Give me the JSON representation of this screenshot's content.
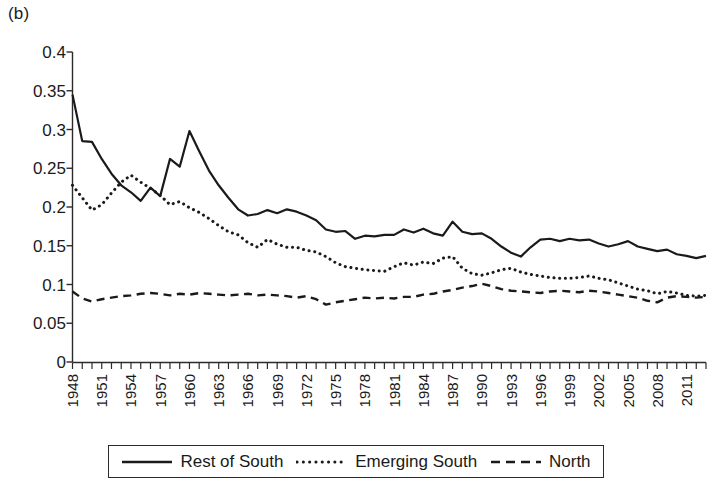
{
  "figure": {
    "panel_label": "(b)",
    "background_color": "#ffffff",
    "line_color": "#1a1a1a"
  },
  "legend": {
    "position": "bottom",
    "entries": [
      {
        "label": "Rest of South",
        "style": "solid",
        "name": "rest-of-south"
      },
      {
        "label": "Emerging South",
        "style": "dotted",
        "name": "emerging-south"
      },
      {
        "label": "North",
        "style": "dashed",
        "name": "north"
      }
    ]
  },
  "axes": {
    "y_ticks": [
      "0.4",
      "0.35",
      "0.3",
      "0.25",
      "0.2",
      "0.15",
      "0.1",
      "0.05",
      "0"
    ],
    "y_min": 0,
    "y_max": 0.4,
    "y_step": 0.05,
    "x_ticks": [
      "1948",
      "1951",
      "1954",
      "1957",
      "1960",
      "1963",
      "1966",
      "1969",
      "1972",
      "1975",
      "1978",
      "1981",
      "1984",
      "1987",
      "1990",
      "1993",
      "1996",
      "1999",
      "2002",
      "2005",
      "2008",
      "2011"
    ],
    "x_min": 1948,
    "x_max": 2013,
    "x_label_step": 3,
    "grid": false
  },
  "chart_data": {
    "type": "line",
    "title": "",
    "subtitle": "",
    "xlabel": "",
    "ylabel": "",
    "xlim": [
      1948,
      2013
    ],
    "ylim": [
      0,
      0.4
    ],
    "grid": false,
    "legend_position": "bottom",
    "x": [
      1948,
      1949,
      1950,
      1951,
      1952,
      1953,
      1954,
      1955,
      1956,
      1957,
      1958,
      1959,
      1960,
      1961,
      1962,
      1963,
      1964,
      1965,
      1966,
      1967,
      1968,
      1969,
      1970,
      1971,
      1972,
      1973,
      1974,
      1975,
      1976,
      1977,
      1978,
      1979,
      1980,
      1981,
      1982,
      1983,
      1984,
      1985,
      1986,
      1987,
      1988,
      1989,
      1990,
      1991,
      1992,
      1993,
      1994,
      1995,
      1996,
      1997,
      1998,
      1999,
      2000,
      2001,
      2002,
      2003,
      2004,
      2005,
      2006,
      2007,
      2008,
      2009,
      2010,
      2011,
      2012,
      2013
    ],
    "series": [
      {
        "name": "Rest of South",
        "style": "solid",
        "values": [
          0.345,
          0.285,
          0.284,
          0.262,
          0.243,
          0.228,
          0.219,
          0.208,
          0.225,
          0.214,
          0.262,
          0.252,
          0.298,
          0.272,
          0.247,
          0.228,
          0.212,
          0.197,
          0.189,
          0.191,
          0.196,
          0.192,
          0.197,
          0.194,
          0.189,
          0.183,
          0.171,
          0.168,
          0.169,
          0.159,
          0.163,
          0.162,
          0.164,
          0.164,
          0.171,
          0.167,
          0.172,
          0.166,
          0.163,
          0.181,
          0.168,
          0.165,
          0.166,
          0.159,
          0.149,
          0.141,
          0.136,
          0.148,
          0.158,
          0.159,
          0.156,
          0.159,
          0.157,
          0.158,
          0.153,
          0.149,
          0.152,
          0.156,
          0.149,
          0.146,
          0.143,
          0.145,
          0.139,
          0.137,
          0.134,
          0.137
        ]
      },
      {
        "name": "Emerging South",
        "style": "dotted",
        "values": [
          0.228,
          0.212,
          0.196,
          0.203,
          0.218,
          0.232,
          0.241,
          0.232,
          0.224,
          0.215,
          0.203,
          0.207,
          0.199,
          0.193,
          0.185,
          0.176,
          0.168,
          0.164,
          0.154,
          0.148,
          0.158,
          0.152,
          0.148,
          0.148,
          0.144,
          0.142,
          0.136,
          0.128,
          0.123,
          0.121,
          0.119,
          0.118,
          0.117,
          0.123,
          0.128,
          0.125,
          0.129,
          0.127,
          0.134,
          0.136,
          0.121,
          0.114,
          0.112,
          0.115,
          0.119,
          0.121,
          0.116,
          0.113,
          0.111,
          0.109,
          0.108,
          0.108,
          0.109,
          0.111,
          0.108,
          0.106,
          0.102,
          0.098,
          0.094,
          0.092,
          0.088,
          0.091,
          0.089,
          0.086,
          0.085,
          0.086
        ]
      },
      {
        "name": "North",
        "style": "dashed",
        "values": [
          0.091,
          0.082,
          0.078,
          0.081,
          0.083,
          0.085,
          0.086,
          0.088,
          0.089,
          0.088,
          0.086,
          0.088,
          0.087,
          0.089,
          0.088,
          0.087,
          0.086,
          0.087,
          0.088,
          0.086,
          0.087,
          0.086,
          0.085,
          0.083,
          0.085,
          0.081,
          0.074,
          0.077,
          0.079,
          0.081,
          0.083,
          0.082,
          0.083,
          0.082,
          0.084,
          0.084,
          0.087,
          0.088,
          0.091,
          0.093,
          0.096,
          0.098,
          0.101,
          0.098,
          0.094,
          0.092,
          0.091,
          0.09,
          0.089,
          0.091,
          0.092,
          0.091,
          0.09,
          0.092,
          0.091,
          0.089,
          0.087,
          0.085,
          0.083,
          0.079,
          0.077,
          0.083,
          0.085,
          0.084,
          0.083,
          0.084
        ]
      }
    ]
  }
}
